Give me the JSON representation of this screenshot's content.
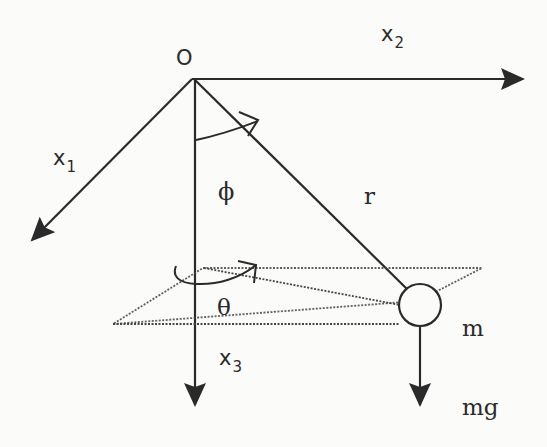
{
  "diagram": {
    "type": "spherical-pendulum",
    "labels": {
      "origin": "O",
      "x1": "x",
      "x1_sub": "1",
      "x2": "x",
      "x2_sub": "2",
      "x3": "x",
      "x3_sub": "3",
      "phi": "ϕ",
      "theta": "θ",
      "r": "r",
      "mass": "m",
      "force": "mg"
    },
    "colors": {
      "ink": "#2a2a2a",
      "background": "#fbfbfa"
    }
  }
}
